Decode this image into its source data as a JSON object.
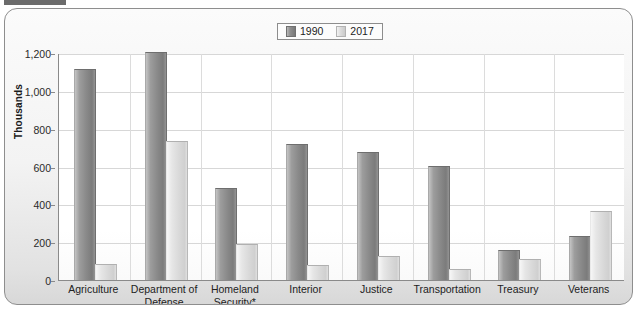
{
  "panel": {
    "name": "federal-employment-bar-chart"
  },
  "legend": {
    "position": "top-center",
    "entries": [
      {
        "label": "1990",
        "color": "#8a8a8a",
        "icon": "legend-swatch-icon"
      },
      {
        "label": "2017",
        "color": "#d9d9d9",
        "icon": "legend-swatch-icon"
      }
    ]
  },
  "yaxis": {
    "title": "Thousands",
    "ticks": [
      "1,200",
      "1,000",
      "800",
      "600",
      "400",
      "200",
      "0"
    ]
  },
  "chart_data": {
    "type": "bar",
    "title": "",
    "subtitle": "",
    "xlabel": "",
    "ylabel": "Thousands",
    "ylim": [
      0,
      1200
    ],
    "ytick_values": [
      0,
      200,
      400,
      600,
      800,
      1000,
      1200
    ],
    "grid": true,
    "legend_position": "top-center",
    "categories": [
      "Agriculture",
      "Department of Defense",
      "Homeland Security*",
      "Interior",
      "Justice",
      "Transportation",
      "Treasury",
      "Veterans"
    ],
    "category_lines": [
      [
        "Agriculture"
      ],
      [
        "Department of",
        "Defense"
      ],
      [
        "Homeland",
        "Security*"
      ],
      [
        "Interior"
      ],
      [
        "Justice"
      ],
      [
        "Transportation"
      ],
      [
        "Treasury"
      ],
      [
        "Veterans"
      ]
    ],
    "series": [
      {
        "name": "1990",
        "color": "#8a8a8a",
        "values": [
          1110,
          1200,
          480,
          715,
          670,
          600,
          153,
          225
        ]
      },
      {
        "name": "2017",
        "color": "#d9d9d9",
        "values": [
          80,
          730,
          185,
          75,
          122,
          55,
          104,
          358
        ]
      }
    ],
    "footnote": "*"
  }
}
